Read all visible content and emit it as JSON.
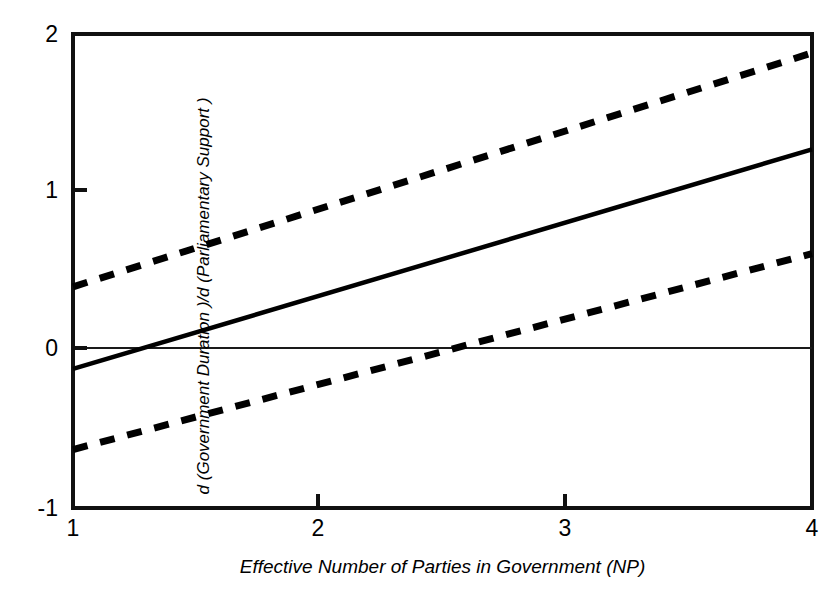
{
  "chart_data": {
    "type": "line",
    "title": "",
    "subtitle": "",
    "xlabel": "Effective Number of Parties in Government  (NP)",
    "ylabel": "d (Government Duration )/d (Parliamentary Support )",
    "xlim": [
      1,
      4
    ],
    "ylim": [
      -1,
      2
    ],
    "xticks": [
      1,
      2,
      3,
      4
    ],
    "xticklabels": [
      "1",
      "2",
      "3",
      "4"
    ],
    "yticks": [
      -1,
      0,
      1,
      2
    ],
    "yticklabels": [
      "-1",
      "0",
      "1",
      "2"
    ],
    "grid": false,
    "legend": "none",
    "zero_line": 0,
    "x": [
      1,
      4
    ],
    "series": [
      {
        "name": "Upper 95% confidence bound",
        "style": "dashed",
        "values": [
          0.4,
          1.88
        ],
        "zero_crossing": null
      },
      {
        "name": "Marginal effect estimate",
        "style": "solid",
        "values": [
          -0.12,
          1.27
        ],
        "zero_crossing": 1.25
      },
      {
        "name": "Lower 95% confidence bound",
        "style": "dashed",
        "values": [
          -0.63,
          0.61
        ],
        "zero_crossing": 1.97
      }
    ],
    "colors": {
      "line": "#000000",
      "axis": "#000000",
      "background": "#ffffff"
    }
  },
  "axes": {
    "x_tick_labels": [
      "1",
      "2",
      "3",
      "4"
    ],
    "y_tick_labels": [
      "2",
      "1",
      "0",
      "-1"
    ],
    "x_title": "Effective Number of Parties in Government  (NP)",
    "y_title": "d (Government Duration )/d (Parliamentary Support )"
  }
}
